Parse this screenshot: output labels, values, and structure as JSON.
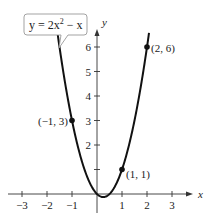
{
  "chart_data": {
    "type": "line",
    "title": "",
    "equation_label": "y = 2x² − x",
    "equation_parts": {
      "lhs": "y = 2x",
      "exp": "2",
      "rhs": " − x"
    },
    "xlabel": "x",
    "ylabel": "y",
    "xlim": [
      -3.4,
      3.8
    ],
    "ylim": [
      -0.6,
      6.8
    ],
    "x_ticks": [
      -3,
      -2,
      -1,
      1,
      2,
      3
    ],
    "x_tick_labels": [
      "−3",
      "−2",
      "−1",
      "1",
      "2",
      "3"
    ],
    "y_ticks": [
      1,
      2,
      3,
      4,
      5,
      6
    ],
    "y_tick_labels": [
      "",
      "2",
      "3",
      "4",
      "5",
      "6"
    ],
    "grid": false,
    "series": [
      {
        "name": "y = 2x^2 - x",
        "function": "2*x*x - x",
        "x_range": [
          -1.62,
          2.08
        ],
        "color": "#111111"
      }
    ],
    "points": [
      {
        "x": -1,
        "y": 3,
        "label": "(−1, 3)"
      },
      {
        "x": 1,
        "y": 1,
        "label": "(1, 1)"
      },
      {
        "x": 2,
        "y": 6,
        "label": "(2, 6)"
      }
    ]
  }
}
